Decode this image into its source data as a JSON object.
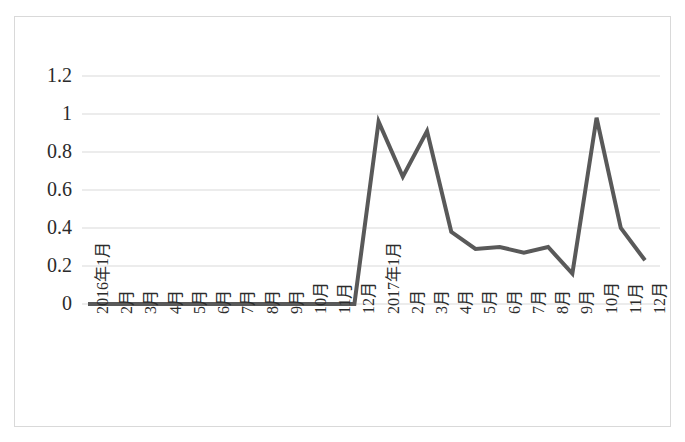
{
  "chart_data": {
    "type": "line",
    "title": "",
    "subtitle": "",
    "xlabel": "",
    "ylabel": "",
    "grid": true,
    "legend": "none",
    "ylim": [
      0,
      1.2
    ],
    "ytick_labels": [
      "1.2",
      "1",
      "0.8",
      "0.6",
      "0.4",
      "0.2",
      "0"
    ],
    "ytick_values": [
      1.2,
      1,
      0.8,
      0.6,
      0.4,
      0.2,
      0
    ],
    "categories": [
      "2016年1月",
      "2月",
      "3月",
      "4月",
      "5月",
      "6月",
      "7月",
      "8月",
      "9月",
      "10月",
      "11月",
      "12月",
      "2017年1月",
      "2月",
      "3月",
      "4月",
      "5月",
      "6月",
      "7月",
      "8月",
      "9月",
      "10月",
      "11月",
      "12月"
    ],
    "series": [
      {
        "name": "series-1",
        "color": "#595959",
        "values": [
          0,
          0,
          0,
          0,
          0,
          0,
          0,
          0,
          0,
          0,
          0,
          0,
          0.96,
          0.67,
          0.91,
          0.38,
          0.29,
          0.3,
          0.27,
          0.3,
          0.16,
          0.98,
          0.4,
          0.23
        ]
      }
    ]
  },
  "style": {
    "line_color": "#595959",
    "grid_color": "#d9d9d9",
    "border_color": "#d9d9d9",
    "text_color": "#2b2b2b",
    "background": "#ffffff",
    "line_width": 4
  }
}
